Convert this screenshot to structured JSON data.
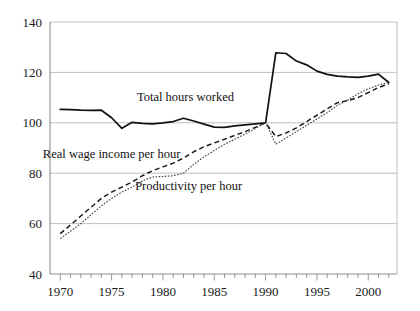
{
  "chart_data": {
    "type": "line",
    "title": "",
    "xlabel": "",
    "ylabel": "",
    "xlim": [
      1969,
      2002.8
    ],
    "ylim": [
      40,
      140
    ],
    "xticks_labeled": [
      1970,
      1975,
      1980,
      1985,
      1990,
      1995,
      2000
    ],
    "xticks_minor_step": 1,
    "yticks": [
      40,
      60,
      80,
      100,
      120,
      140
    ],
    "grid": "horizontal",
    "legend": "inline-annotations",
    "index_base": "1990 = 100",
    "x": [
      1970,
      1971,
      1972,
      1973,
      1974,
      1975,
      1976,
      1977,
      1978,
      1979,
      1980,
      1981,
      1982,
      1983,
      1984,
      1985,
      1986,
      1987,
      1988,
      1989,
      1990,
      1991,
      1992,
      1993,
      1994,
      1995,
      1996,
      1997,
      1998,
      1999,
      2000,
      2001,
      2002
    ],
    "series": [
      {
        "name": "Total hours worked",
        "style": "solid",
        "label_x": 1982.2,
        "label_y": 108.5,
        "values": [
          105.3,
          105.2,
          105.0,
          104.9,
          105.0,
          102.0,
          97.8,
          100.2,
          99.8,
          99.6,
          100.0,
          100.5,
          101.8,
          100.7,
          99.5,
          98.3,
          98.2,
          98.8,
          99.2,
          99.6,
          100.0,
          127.8,
          127.5,
          124.5,
          123.0,
          120.5,
          119.2,
          118.5,
          118.2,
          118.0,
          118.5,
          119.3,
          116.0
        ]
      },
      {
        "name": "Real wage income per hour",
        "style": "dashed",
        "label_x": 1975.0,
        "label_y": 86.0,
        "values": [
          56.0,
          59.5,
          63.0,
          66.5,
          70.0,
          72.5,
          74.5,
          76.5,
          79.0,
          81.0,
          82.5,
          84.0,
          86.0,
          88.5,
          90.5,
          92.0,
          93.5,
          95.0,
          96.5,
          98.2,
          100.0,
          94.5,
          96.0,
          98.0,
          100.5,
          103.0,
          105.5,
          108.0,
          108.8,
          110.0,
          112.0,
          114.0,
          115.5
        ]
      },
      {
        "name": "Productivity per hour",
        "style": "dotted",
        "label_x": 1982.5,
        "label_y": 73.5,
        "values": [
          54.0,
          57.0,
          60.0,
          63.5,
          67.0,
          70.0,
          72.5,
          74.5,
          77.0,
          78.5,
          78.7,
          79.0,
          80.0,
          83.5,
          86.5,
          89.0,
          91.5,
          93.5,
          95.5,
          97.8,
          100.0,
          91.5,
          94.0,
          96.5,
          99.0,
          101.5,
          104.0,
          107.0,
          109.0,
          111.5,
          113.5,
          115.0,
          116.0
        ]
      }
    ]
  },
  "axis": {
    "y_tick_labels": [
      "140",
      "120",
      "100",
      "80",
      "60",
      "40"
    ],
    "x_tick_labels": [
      "1970",
      "1975",
      "1980",
      "1985",
      "1990",
      "1995",
      "2000"
    ]
  },
  "annotations": {
    "total_hours_worked": "Total hours worked",
    "real_wage_income_per_hour": "Real wage income per hour",
    "productivity_per_hour": "Productivity per hour"
  },
  "colors": {
    "background": "#ffffff",
    "gridline": "#b9b9b9",
    "axis": "#8d8d8d",
    "solid_series": "#111111",
    "dashed_series": "#1b1b1b",
    "dotted_series": "#4a4a4a",
    "text": "#1a1a1a"
  }
}
